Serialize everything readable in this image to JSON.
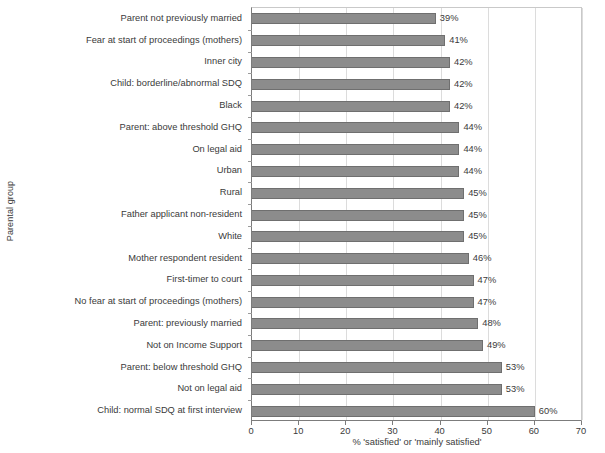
{
  "chart": {
    "title": "",
    "ylabel": "Parental group",
    "xlabel": "% 'satisfied' or 'mainly satisfied'"
  },
  "chart_data": {
    "type": "bar",
    "orientation": "horizontal",
    "title": "",
    "xlabel": "% 'satisfied' or 'mainly satisfied'",
    "ylabel": "Parental group",
    "xlim": [
      0,
      70
    ],
    "xticks": [
      0,
      10,
      20,
      30,
      40,
      50,
      60,
      70
    ],
    "grid": true,
    "grid_axis": "x",
    "legend": false,
    "bar_color": "#8c8c8c",
    "bar_edge_color": "#6f6f6f",
    "value_label_suffix": "%",
    "categories": [
      "Parent not previously married",
      "Fear at start of proceedings (mothers)",
      "Inner city",
      "Child: borderline/abnormal SDQ",
      "Black",
      "Parent: above threshold GHQ",
      "On legal aid",
      "Urban",
      "Rural",
      "Father applicant non-resident",
      "White",
      "Mother respondent resident",
      "First-timer to court",
      "No fear at start of proceedings (mothers)",
      "Parent: previously married",
      "Not on Income Support",
      "Parent: below threshold GHQ",
      "Not on legal aid",
      "Child: normal SDQ at first interview"
    ],
    "values": [
      39,
      41,
      42,
      42,
      42,
      44,
      44,
      44,
      45,
      45,
      45,
      46,
      47,
      47,
      48,
      49,
      53,
      53,
      60
    ],
    "value_labels": [
      "39%",
      "41%",
      "42%",
      "42%",
      "42%",
      "44%",
      "44%",
      "44%",
      "45%",
      "45%",
      "45%",
      "46%",
      "47%",
      "47%",
      "48%",
      "49%",
      "53%",
      "53%",
      "60%"
    ],
    "xtick_labels": [
      "0",
      "10",
      "20",
      "30",
      "40",
      "50",
      "60",
      "70"
    ]
  }
}
